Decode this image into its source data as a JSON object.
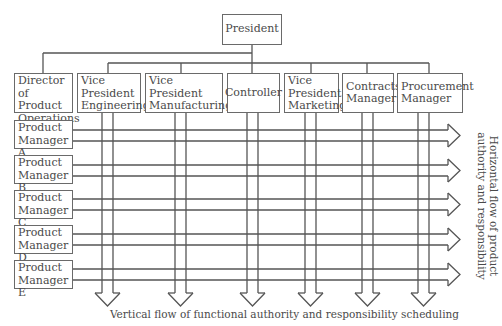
{
  "president": {
    "label": "President"
  },
  "functional_heads": [
    {
      "label": "Director\nof Product\nOperations"
    },
    {
      "label": "Vice\nPresident\nEngineering"
    },
    {
      "label": "Vice\nPresident\nManufacturing"
    },
    {
      "label": "Controller"
    },
    {
      "label": "Vice\nPresident\nMarketing"
    },
    {
      "label": "Contracts\nManager"
    },
    {
      "label": "Procurement\nManager"
    }
  ],
  "product_managers": [
    {
      "label": "Product\nManager A"
    },
    {
      "label": "Product\nManager B"
    },
    {
      "label": "Product\nManager C"
    },
    {
      "label": "Product\nManager D"
    },
    {
      "label": "Product\nManager E"
    }
  ],
  "captions": {
    "vertical": "Vertical flow of functional authority and responsibility scheduling",
    "horizontal": "Horizontal flow of product\nauthority and responsibility"
  },
  "colors": {
    "line": "#555555",
    "box_border": "#6a6a6a",
    "text": "#4a4a4a"
  }
}
